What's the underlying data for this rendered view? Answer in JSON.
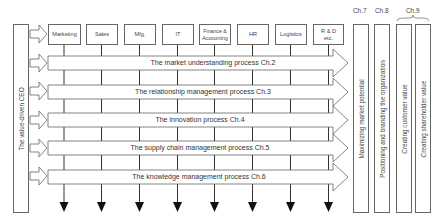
{
  "ceo": {
    "label": "The value-driven CEO"
  },
  "functions": [
    {
      "label": "Marketing"
    },
    {
      "label": "Sales"
    },
    {
      "label": "Mfg."
    },
    {
      "label": "IT"
    },
    {
      "label": "Finance & Accounting"
    },
    {
      "label": "HR"
    },
    {
      "label": "Logistics"
    },
    {
      "label": "R & D etc."
    }
  ],
  "processes": [
    {
      "label": "The market understanding process Ch.2"
    },
    {
      "label": "The relationship management process Ch.3"
    },
    {
      "label": "The innovation process Ch.4"
    },
    {
      "label": "The supply chain management process Ch.5"
    },
    {
      "label": "The knowledge management process Ch.6"
    }
  ],
  "outcomes": [
    {
      "chapter": "Ch.7",
      "label": "Maximizing market potential"
    },
    {
      "chapter": "Ch.8",
      "label": "Positioning and branding the organization"
    },
    {
      "chapter": "Ch.9",
      "label": "Creating customer value"
    },
    {
      "chapter": "",
      "label": "Creating shareholder value"
    }
  ],
  "chapter_labels": {
    "ch7": "Ch.7",
    "ch8": "Ch.8",
    "ch9": "Ch.9"
  },
  "colors": {
    "stroke": "#555555",
    "fill": "#ffffff",
    "text": "#333333"
  }
}
